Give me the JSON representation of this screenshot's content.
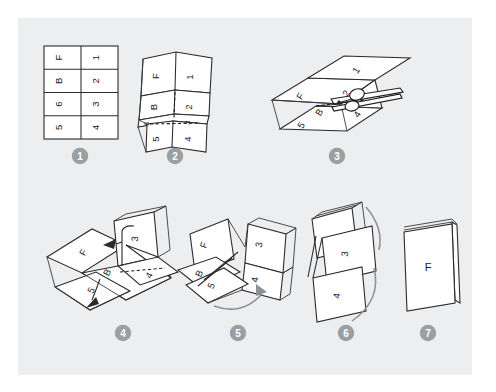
{
  "figure": {
    "background_color": "#ffffff",
    "panel_color": "#eceef0",
    "ink_color": "#2b2b2b",
    "badge_color": "#9a9fa4",
    "paper_color": "#ffffff"
  },
  "steps": [
    {
      "number": "1",
      "badge_label": "1",
      "caption": "",
      "name": "step-1-flat-sheet",
      "description": "Flat sheet ruled into a 2 by 4 grid of eight panels",
      "cells": {
        "left_column": [
          "F",
          "B",
          "6",
          "5"
        ],
        "right_column": [
          "1",
          "2",
          "3",
          "4"
        ]
      }
    },
    {
      "number": "2",
      "badge_label": "2",
      "caption": "",
      "name": "step-2-accordion-fold",
      "description": "Sheet folded lengthwise showing accordion creases with dashed centre fold",
      "labels": [
        "F",
        "1",
        "B",
        "2",
        "6",
        "3",
        "5",
        "4"
      ]
    },
    {
      "number": "3",
      "badge_label": "3",
      "caption": "",
      "name": "step-3-cut-with-scissors",
      "description": "Folded sheet being cut along the central dashed slit with scissors",
      "labels": [
        "F",
        "1",
        "B",
        "2",
        "5",
        "4"
      ],
      "tool": "scissors"
    },
    {
      "number": "4",
      "badge_label": "4",
      "caption": "",
      "name": "step-4-open-and-fold-panels",
      "description": "Sheet opened out with arrows showing panels 3 and 5 folding up",
      "labels": [
        "F",
        "3",
        "B",
        "4",
        "5"
      ]
    },
    {
      "number": "5",
      "badge_label": "5",
      "caption": "",
      "name": "step-5-form-cross",
      "description": "Panels standing up forming a cross shape with arrow showing rotation",
      "labels": [
        "F",
        "3",
        "B",
        "5",
        "4"
      ]
    },
    {
      "number": "6",
      "badge_label": "6",
      "caption": "",
      "name": "step-6-collapse-pages",
      "description": "Pages collapsing together with curved arrows on both sides",
      "labels": [
        "3",
        "4"
      ]
    },
    {
      "number": "7",
      "badge_label": "7",
      "caption": "",
      "name": "step-7-finished-booklet",
      "description": "Finished folded booklet standing upright showing the front cover",
      "labels": [
        "F"
      ]
    }
  ],
  "icons": {
    "scissors": "scissors-icon",
    "fold_arrow": "curved-arrow-icon",
    "dashed_fold": "dashed-fold-line-icon"
  }
}
